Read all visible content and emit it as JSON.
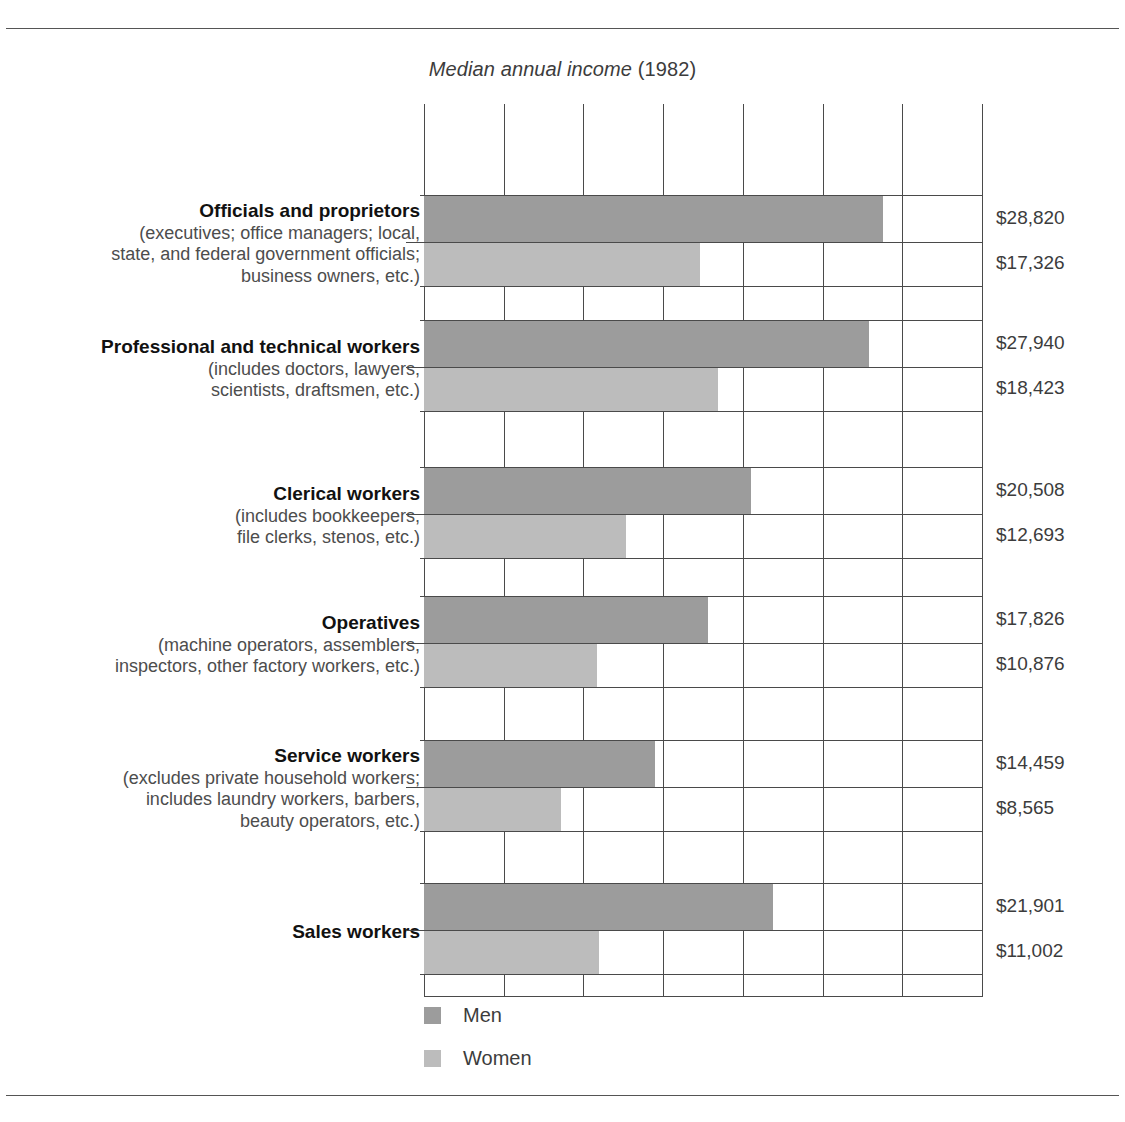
{
  "chart_data": {
    "type": "bar",
    "orientation": "horizontal",
    "title_italic": "Median annual income",
    "title_regular": "(1982)",
    "xlabel": "",
    "ylabel": "",
    "xlim": [
      0,
      35000
    ],
    "grid": true,
    "gridline_step": 5000,
    "legend_position": "bottom-left",
    "categories": [
      "Officials and proprietors",
      "Professional and technical workers",
      "Clerical workers",
      "Operatives",
      "Service workers",
      "Sales workers"
    ],
    "series": [
      {
        "name": "Men",
        "color": "#9c9c9c",
        "values": [
          28820,
          27940,
          20508,
          17826,
          14459,
          21901
        ]
      },
      {
        "name": "Women",
        "color": "#bcbcbc",
        "values": [
          17326,
          18423,
          12693,
          10876,
          8565,
          11002
        ]
      }
    ],
    "value_labels": {
      "men": [
        "$28,820",
        "$27,940",
        "$20,508",
        "$17,826",
        "$14,459",
        "$21,901"
      ],
      "women": [
        "$17,326",
        "$18,423",
        "$12,693",
        "$10,876",
        "$8,565",
        "$11,002"
      ]
    }
  },
  "groups": [
    {
      "name": "Officials and proprietors",
      "desc": "(executives; office managers; local,\nstate, and federal government officials;\nbusiness owners, etc.)",
      "desc_lines": [
        "(executives; office managers; local,",
        "state, and federal government officials;",
        "business owners, etc.)"
      ],
      "men_label": "$28,820",
      "women_label": "$17,326"
    },
    {
      "name": "Professional and technical workers",
      "desc_lines": [
        "(includes doctors, lawyers,",
        "scientists, draftsmen, etc.)"
      ],
      "men_label": "$27,940",
      "women_label": "$18,423"
    },
    {
      "name": "Clerical workers",
      "desc_lines": [
        "(includes bookkeepers,",
        "file clerks, stenos, etc.)"
      ],
      "men_label": "$20,508",
      "women_label": "$12,693"
    },
    {
      "name": "Operatives",
      "desc_lines": [
        "(machine operators, assemblers,",
        "inspectors, other factory workers, etc.)"
      ],
      "men_label": "$17,826",
      "women_label": "$10,876"
    },
    {
      "name": "Service workers",
      "desc_lines": [
        "(excludes private household workers;",
        "includes laundry workers, barbers,",
        "beauty operators, etc.)"
      ],
      "men_label": "$14,459",
      "women_label": "$8,565"
    },
    {
      "name": "Sales workers",
      "desc_lines": [],
      "men_label": "$21,901",
      "women_label": "$11,002"
    }
  ],
  "legend": {
    "men": "Men",
    "women": "Women"
  }
}
